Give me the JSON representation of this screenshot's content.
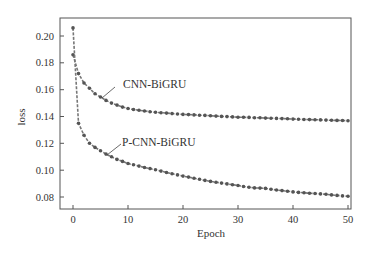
{
  "chart_data": {
    "type": "line",
    "title": "",
    "xlabel": "Epoch",
    "ylabel": "loss",
    "xlim": [
      0,
      50
    ],
    "ylim": [
      0.072,
      0.212
    ],
    "xticks": [
      0,
      10,
      20,
      30,
      40,
      50
    ],
    "xtick_labels": [
      "0",
      "10",
      "20",
      "30",
      "40",
      "50"
    ],
    "yticks": [
      0.08,
      0.1,
      0.12,
      0.14,
      0.16,
      0.18,
      0.2
    ],
    "ytick_labels": [
      "0.08",
      "0.10",
      "0.12",
      "0.14",
      "0.16",
      "0.18",
      "0.20"
    ],
    "grid": false,
    "legend": "inline annotations with leader lines",
    "x": [
      0,
      1,
      2,
      3,
      4,
      5,
      6,
      7,
      8,
      9,
      10,
      11,
      12,
      13,
      14,
      15,
      16,
      17,
      18,
      19,
      20,
      21,
      22,
      23,
      24,
      25,
      26,
      27,
      28,
      29,
      30,
      31,
      32,
      33,
      34,
      35,
      36,
      37,
      38,
      39,
      40,
      41,
      42,
      43,
      44,
      45,
      46,
      47,
      48,
      49,
      50
    ],
    "series": [
      {
        "name": "CNN-BiGRU",
        "color": "#555555",
        "values": [
          0.186,
          0.172,
          0.165,
          0.161,
          0.157,
          0.1545,
          0.152,
          0.15,
          0.1485,
          0.147,
          0.146,
          0.1452,
          0.1446,
          0.1441,
          0.1436,
          0.1432,
          0.1428,
          0.1425,
          0.1422,
          0.1419,
          0.1416,
          0.1414,
          0.1412,
          0.141,
          0.1408,
          0.1405,
          0.1403,
          0.1401,
          0.1399,
          0.1397,
          0.1395,
          0.1394,
          0.1393,
          0.1391,
          0.139,
          0.1388,
          0.1387,
          0.1386,
          0.1384,
          0.1383,
          0.1381,
          0.138,
          0.1378,
          0.1377,
          0.1376,
          0.1375,
          0.1373,
          0.1372,
          0.1371,
          0.137,
          0.1368
        ]
      },
      {
        "name": "P-CNN-BiGRU",
        "color": "#555555",
        "values": [
          0.206,
          0.135,
          0.126,
          0.12,
          0.117,
          0.1145,
          0.112,
          0.11,
          0.108,
          0.1065,
          0.105,
          0.104,
          0.103,
          0.102,
          0.1012,
          0.1003,
          0.0993,
          0.0983,
          0.0974,
          0.0965,
          0.0956,
          0.0948,
          0.094,
          0.0932,
          0.0924,
          0.0916,
          0.091,
          0.0904,
          0.0898,
          0.0892,
          0.0886,
          0.0878,
          0.0872,
          0.0868,
          0.0866,
          0.0864,
          0.0858,
          0.0852,
          0.0848,
          0.0843,
          0.0838,
          0.0834,
          0.0831,
          0.0828,
          0.0826,
          0.0823,
          0.082,
          0.0816,
          0.0812,
          0.0808,
          0.0805
        ]
      }
    ],
    "annotations": [
      {
        "text": "CNN-BiGRU",
        "target_epoch": 5
      },
      {
        "text": "P-CNN-BiGRU",
        "target_epoch": 6
      }
    ]
  },
  "labels": {
    "xlabel": "Epoch",
    "ylabel": "loss",
    "series_a": "CNN-BiGRU",
    "series_b": "P-CNN-BiGRU",
    "xticks": [
      "0",
      "10",
      "20",
      "30",
      "40",
      "50"
    ],
    "yticks": [
      "0.08",
      "0.10",
      "0.12",
      "0.14",
      "0.16",
      "0.18",
      "0.20"
    ]
  }
}
